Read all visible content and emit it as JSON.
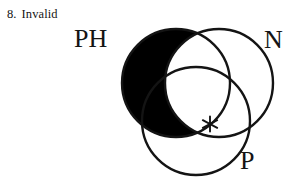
{
  "exercise": {
    "number": "8.",
    "answer": "Invalid"
  },
  "diagram": {
    "type": "venn-3-circle",
    "name": "syllogism-venn-diagram",
    "background_color": "#ffffff",
    "stroke_color": "#141414",
    "shade_color": "#000000",
    "circles": [
      {
        "id": "PH",
        "label": "PH",
        "cx": 176,
        "cy": 83,
        "r": 54
      },
      {
        "id": "N",
        "label": "N",
        "cx": 219,
        "cy": 83,
        "r": 54
      },
      {
        "id": "P",
        "label": "P",
        "cx": 196,
        "cy": 121,
        "r": 54
      }
    ],
    "shaded_regions": [
      {
        "description": "PH minus N",
        "fill": "#000000"
      }
    ],
    "markers": [
      {
        "symbol": "*",
        "name": "existential-asterisk",
        "x": 210,
        "y": 124,
        "region": "N and P, outside PH"
      }
    ]
  }
}
